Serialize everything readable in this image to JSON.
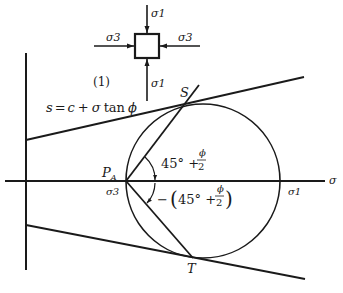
{
  "diagram": {
    "element": {
      "label": "(1)",
      "top_stress": "σ1",
      "bottom_stress": "σ1",
      "left_stress": "σ3",
      "right_stress": "σ3"
    },
    "envelope_equation": {
      "lhs": "s",
      "eq": "=",
      "c": "c",
      "plus": "+",
      "sigma": "σ",
      "tan": "tan",
      "phi": "ϕ"
    },
    "points": {
      "S": "S",
      "T": "T",
      "pole": "P",
      "pole_sub": "A"
    },
    "axis": {
      "sigma_label": "σ",
      "sigma3_label": "σ3",
      "sigma1_label": "σ1"
    },
    "angles": {
      "upper": {
        "prefix": "45° +",
        "num": "ϕ",
        "den": "2"
      },
      "lower": {
        "prefix": "− (45° +",
        "num": "ϕ",
        "den": "2",
        "suffix": ")"
      }
    },
    "colors": {
      "ink": "#1a1a1a",
      "background": "#ffffff"
    }
  }
}
